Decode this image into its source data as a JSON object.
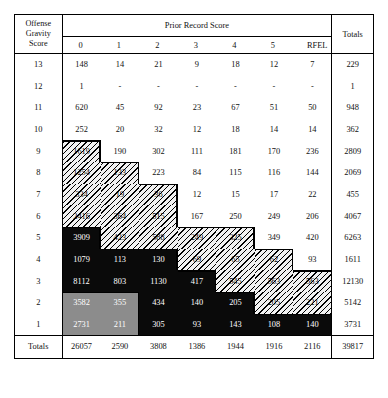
{
  "table": {
    "corner_header": "Offense Gravity Score",
    "corner_header_lines": [
      "Offense",
      "Gravity",
      "Score"
    ],
    "group_header": "Prior Record Score",
    "column_headers": [
      "0",
      "1",
      "2",
      "3",
      "4",
      "5",
      "RFEL"
    ],
    "totals_header": "Totals",
    "totals_row_label": "Totals",
    "rows": [
      {
        "label": "13",
        "cells": [
          "148",
          "14",
          "21",
          "9",
          "18",
          "12",
          "7"
        ],
        "total": "229",
        "shade": [
          "white",
          "white",
          "white",
          "white",
          "white",
          "white",
          "white"
        ]
      },
      {
        "label": "12",
        "cells": [
          "1",
          "-",
          "-",
          "-",
          "-",
          "-",
          "-"
        ],
        "total": "1",
        "shade": [
          "white",
          "white",
          "white",
          "white",
          "white",
          "white",
          "white"
        ]
      },
      {
        "label": "11",
        "cells": [
          "620",
          "45",
          "92",
          "23",
          "67",
          "51",
          "50"
        ],
        "total": "948",
        "shade": [
          "white",
          "white",
          "white",
          "white",
          "white",
          "white",
          "white"
        ]
      },
      {
        "label": "10",
        "cells": [
          "252",
          "20",
          "32",
          "12",
          "18",
          "14",
          "14"
        ],
        "total": "362",
        "shade": [
          "white",
          "white",
          "white",
          "white",
          "white",
          "white",
          "white"
        ]
      },
      {
        "label": "9",
        "cells": [
          "1619",
          "190",
          "302",
          "111",
          "181",
          "170",
          "236"
        ],
        "total": "2809",
        "shade": [
          "hatch",
          "white",
          "white",
          "white",
          "white",
          "white",
          "white"
        ]
      },
      {
        "label": "8",
        "cells": [
          "1254",
          "133",
          "223",
          "84",
          "115",
          "116",
          "144"
        ],
        "total": "2069",
        "shade": [
          "hatch",
          "hatch",
          "white",
          "white",
          "white",
          "white",
          "white"
        ]
      },
      {
        "label": "7",
        "cells": [
          "334",
          "19",
          "36",
          "12",
          "15",
          "17",
          "22"
        ],
        "total": "455",
        "shade": [
          "hatch",
          "hatch",
          "hatch",
          "white",
          "white",
          "white",
          "white"
        ]
      },
      {
        "label": "6",
        "cells": [
          "2416",
          "364",
          "515",
          "167",
          "250",
          "249",
          "206"
        ],
        "total": "4067",
        "shade": [
          "hatch",
          "hatch",
          "hatch",
          "white",
          "white",
          "white",
          "white"
        ]
      },
      {
        "label": "5",
        "cells": [
          "3909",
          "423",
          "588",
          "249",
          "325",
          "349",
          "420"
        ],
        "total": "6263",
        "shade": [
          "black",
          "hatch",
          "hatch",
          "hatch",
          "hatch",
          "white",
          "white"
        ]
      },
      {
        "label": "4",
        "cells": [
          "1079",
          "113",
          "130",
          "69",
          "65",
          "62",
          "93"
        ],
        "total": "1611",
        "shade": [
          "black",
          "black",
          "black",
          "hatch",
          "hatch",
          "hatch",
          "white"
        ]
      },
      {
        "label": "3",
        "cells": [
          "8112",
          "803",
          "1130",
          "417",
          "545",
          "563",
          "563"
        ],
        "total": "12130",
        "shade": [
          "black",
          "black",
          "black",
          "black",
          "hatch",
          "hatch",
          "hatch"
        ]
      },
      {
        "label": "2",
        "cells": [
          "3582",
          "355",
          "434",
          "140",
          "205",
          "205",
          "221"
        ],
        "total": "5142",
        "shade": [
          "gray",
          "gray",
          "black",
          "black",
          "black",
          "hatch",
          "hatch"
        ]
      },
      {
        "label": "1",
        "cells": [
          "2731",
          "211",
          "305",
          "93",
          "143",
          "108",
          "140"
        ],
        "total": "3731",
        "shade": [
          "gray",
          "gray",
          "black",
          "black",
          "black",
          "black",
          "black"
        ]
      }
    ],
    "totals_row": {
      "label": "Totals",
      "cells": [
        "26057",
        "2590",
        "3808",
        "1386",
        "1944",
        "1916",
        "2116"
      ],
      "total": "39817"
    }
  },
  "colors": {
    "black_region": "#0a0a0a",
    "gray_region": "#8c8c8c",
    "hatch_region": "#f2f2f2",
    "border": "#000000",
    "text": "#111111"
  }
}
